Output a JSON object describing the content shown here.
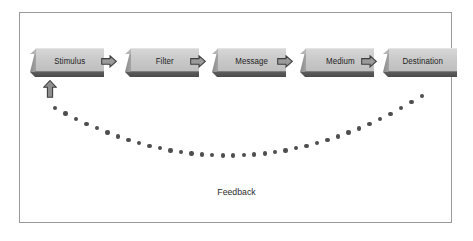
{
  "diagram": {
    "frame": {
      "border_color": "#9a9a9a",
      "background": "#ffffff"
    },
    "node_face_color": "#c9c9c9",
    "node_shadow_color": "#4a4a4a",
    "connector_color": "#808080",
    "dot_color": "#4e4e4e",
    "text_color": "#1d1d1d",
    "nodes": [
      {
        "id": "stimulus",
        "label": "Stimulus",
        "x": 30,
        "y": 48
      },
      {
        "id": "filter",
        "label": "Filter",
        "x": 125,
        "y": 48
      },
      {
        "id": "message",
        "label": "Message",
        "x": 212,
        "y": 48
      },
      {
        "id": "medium",
        "label": "Medium",
        "x": 300,
        "y": 48
      },
      {
        "id": "destination",
        "label": "Destination",
        "x": 383,
        "y": 48
      }
    ],
    "arrows": [
      {
        "id": "arrow-stimulus-filter",
        "from": "stimulus",
        "to": "filter",
        "direction": "right",
        "x": 101,
        "y": 55
      },
      {
        "id": "arrow-filter-message",
        "from": "filter",
        "to": "message",
        "direction": "right",
        "x": 190,
        "y": 55
      },
      {
        "id": "arrow-message-medium",
        "from": "message",
        "to": "medium",
        "direction": "right",
        "x": 277,
        "y": 55
      },
      {
        "id": "arrow-medium-destination",
        "from": "medium",
        "to": "destination",
        "direction": "right",
        "x": 361,
        "y": 55
      }
    ],
    "feedback": {
      "label": "Feedback",
      "style": "dotted",
      "from": "destination",
      "to": "stimulus",
      "arrow": {
        "id": "arrow-feedback-up",
        "direction": "up",
        "x": 43,
        "y": 80
      },
      "dot_count": 36,
      "curve": {
        "start": {
          "x": 422,
          "y": 96
        },
        "end": {
          "x": 55,
          "y": 108
        },
        "lowest_y": 168
      }
    }
  }
}
